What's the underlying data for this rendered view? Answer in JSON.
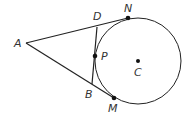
{
  "diagram": {
    "type": "circle-tangent-geometry",
    "labels": {
      "A": "A",
      "D": "D",
      "N": "N",
      "P": "P",
      "C": "C",
      "B": "B",
      "M": "M"
    },
    "colors": {
      "stroke": "#222222",
      "label": "#333333",
      "background": "#ffffff"
    }
  }
}
